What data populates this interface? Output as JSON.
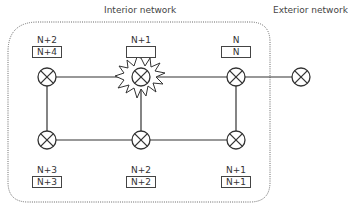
{
  "titles": {
    "interior": "Interior network",
    "exterior": "Exterior network"
  },
  "nodes": {
    "top_left": {
      "label": "N+2",
      "box": "N+4"
    },
    "top_mid": {
      "label": "N+1",
      "box": ""
    },
    "top_right": {
      "label": "N",
      "box": "N"
    },
    "bot_left": {
      "label": "N+3",
      "box": "N+3"
    },
    "bot_mid": {
      "label": "N+2",
      "box": "N+2"
    },
    "bot_right": {
      "label": "N+1",
      "box": "N+1"
    }
  },
  "icons": {
    "node": "router-cross-circle-icon",
    "failure": "explosion-burst-icon"
  }
}
